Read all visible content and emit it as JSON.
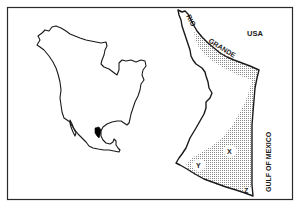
{
  "figure": {
    "frame_color": "#2a2a2a",
    "outline_color": "#1a1a1a",
    "highlight_color": "#000000",
    "stipple_color": "#9a9a9a"
  },
  "overview_map": {
    "region": "North America",
    "highlighted_area": "Tamaulipas region, northeastern Mexico"
  },
  "detail_map": {
    "labels": {
      "river_part1": "RIO",
      "river_part2": "GRANDE",
      "country": "USA",
      "sea": "GULF OF MEXICO",
      "site_x": "X",
      "site_y": "Y",
      "site_z": "Z"
    }
  }
}
